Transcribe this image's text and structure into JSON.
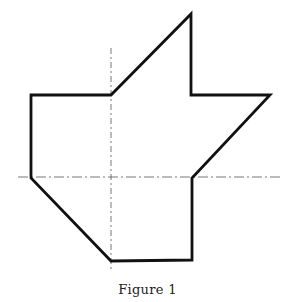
{
  "figure": {
    "caption": "Figure 1",
    "stroke_color": "#111111",
    "axis_color": "#555555",
    "shape_vertices": [
      [
        191,
        14
      ],
      [
        191,
        95
      ],
      [
        270,
        95
      ],
      [
        192,
        178
      ],
      [
        192,
        260
      ],
      [
        111,
        261
      ],
      [
        31,
        178
      ],
      [
        31,
        95
      ],
      [
        111,
        95
      ]
    ],
    "axes": {
      "horizontal": {
        "x1": 18,
        "x2": 283,
        "y": 177
      },
      "vertical": {
        "x": 111,
        "y1": 48,
        "y2": 272
      }
    }
  }
}
